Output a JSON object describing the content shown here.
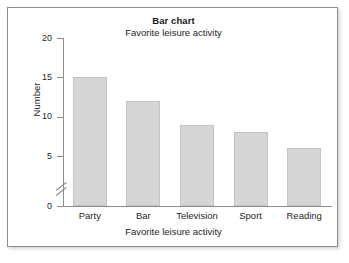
{
  "chart_data": {
    "type": "bar",
    "title": "Bar chart",
    "subtitle": "Favorite leisure activity",
    "xlabel": "Favorite leisure activity",
    "ylabel": "Number",
    "categories": [
      "Party",
      "Bar",
      "Television",
      "Sport",
      "Reading"
    ],
    "values": [
      15,
      12,
      9,
      8,
      6
    ],
    "ylim": [
      0,
      20
    ],
    "yticks": [
      0,
      5,
      10,
      15,
      20
    ],
    "ytick_labels": [
      "0",
      "5",
      "10",
      "15",
      "20"
    ],
    "axis_break": true,
    "axis_break_between": [
      0,
      5
    ],
    "grid": false,
    "legend": false,
    "colors": {
      "bar_fill": "#d6d6d6",
      "bar_border": "#c2c2c2",
      "axis": "#8d8d8d",
      "text": "#262626",
      "frame_border": "#8d8d8d",
      "background": "#ffffff"
    }
  }
}
